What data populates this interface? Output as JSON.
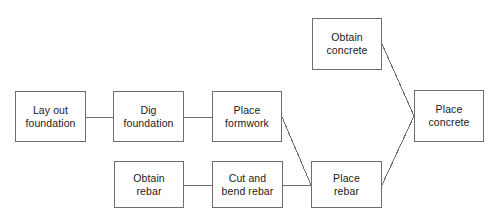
{
  "diagram": {
    "type": "flowchart",
    "canvas": {
      "width": 496,
      "height": 224,
      "background": "#ffffff"
    },
    "style": {
      "box_border_color": "#6e6e6e",
      "connector_color": "#6e6e6e",
      "box_fill": "#ffffff",
      "text_color": "#1a1a1a"
    },
    "nodes": [
      {
        "id": "lay-out-foundation",
        "label": "Lay out\nfoundation",
        "x": 15,
        "y": 91,
        "w": 71,
        "h": 51
      },
      {
        "id": "dig-foundation",
        "label": "Dig\nfoundation",
        "x": 113,
        "y": 91,
        "w": 71,
        "h": 51
      },
      {
        "id": "place-formwork",
        "label": "Place\nformwork",
        "x": 212,
        "y": 91,
        "w": 70,
        "h": 51
      },
      {
        "id": "obtain-concrete",
        "label": "Obtain\nconcrete",
        "x": 312,
        "y": 18,
        "w": 70,
        "h": 52
      },
      {
        "id": "place-concrete",
        "label": "Place\nconcrete",
        "x": 414,
        "y": 90,
        "w": 70,
        "h": 52
      },
      {
        "id": "obtain-rebar",
        "label": "Obtain\nrebar",
        "x": 114,
        "y": 161,
        "w": 70,
        "h": 47
      },
      {
        "id": "cut-and-bend-rebar",
        "label": "Cut and\nbend rebar",
        "x": 212,
        "y": 161,
        "w": 71,
        "h": 47
      },
      {
        "id": "place-rebar",
        "label": "Place\nrebar",
        "x": 311,
        "y": 161,
        "w": 71,
        "h": 47
      }
    ],
    "edges": [
      {
        "id": "edge-lay-out-foundation-to-dig-foundation",
        "from": "lay-out-foundation",
        "to": "dig-foundation",
        "kind": "horizontal",
        "x1": 86,
        "y1": 117,
        "x2": 113,
        "y2": 117
      },
      {
        "id": "edge-dig-foundation-to-place-formwork",
        "from": "dig-foundation",
        "to": "place-formwork",
        "kind": "horizontal",
        "x1": 184,
        "y1": 117,
        "x2": 212,
        "y2": 117
      },
      {
        "id": "edge-place-formwork-to-place-rebar",
        "from": "place-formwork",
        "to": "place-rebar",
        "kind": "diagonal",
        "x1": 282,
        "y1": 117,
        "x2": 311,
        "y2": 185
      },
      {
        "id": "edge-obtain-rebar-to-cut-and-bend-rebar",
        "from": "obtain-rebar",
        "to": "cut-and-bend-rebar",
        "kind": "horizontal",
        "x1": 184,
        "y1": 185,
        "x2": 212,
        "y2": 185
      },
      {
        "id": "edge-cut-and-bend-rebar-to-place-rebar",
        "from": "cut-and-bend-rebar",
        "to": "place-rebar",
        "kind": "horizontal",
        "x1": 283,
        "y1": 185,
        "x2": 311,
        "y2": 185
      },
      {
        "id": "edge-obtain-concrete-to-place-concrete",
        "from": "obtain-concrete",
        "to": "place-concrete",
        "kind": "diagonal",
        "x1": 382,
        "y1": 44,
        "x2": 414,
        "y2": 116
      },
      {
        "id": "edge-place-rebar-to-place-concrete",
        "from": "place-rebar",
        "to": "place-concrete",
        "kind": "diagonal",
        "x1": 382,
        "y1": 185,
        "x2": 414,
        "y2": 116
      }
    ]
  }
}
